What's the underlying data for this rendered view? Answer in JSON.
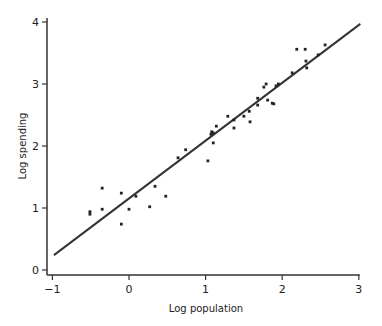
{
  "chart_data": {
    "type": "scatter",
    "title": "",
    "xlabel": "Log population",
    "ylabel": "Log spending",
    "xlim": [
      -1,
      3
    ],
    "ylim": [
      0,
      4
    ],
    "xticks": [
      -1,
      0,
      1,
      2,
      3
    ],
    "yticks": [
      0,
      1,
      2,
      3,
      4
    ],
    "xtick_labels": [
      "−1",
      "0",
      "1",
      "2",
      "3"
    ],
    "ytick_labels": [
      "0",
      "1",
      "2",
      "3",
      "4"
    ],
    "grid": false,
    "legend": null,
    "series": [
      {
        "name": "observations",
        "type": "scatter",
        "points": [
          [
            -0.51,
            0.94
          ],
          [
            -0.51,
            0.9
          ],
          [
            -0.35,
            1.32
          ],
          [
            -0.35,
            0.98
          ],
          [
            -0.1,
            1.24
          ],
          [
            -0.1,
            0.74
          ],
          [
            0.0,
            0.98
          ],
          [
            0.09,
            1.19
          ],
          [
            0.27,
            1.02
          ],
          [
            0.34,
            1.35
          ],
          [
            0.48,
            1.19
          ],
          [
            0.64,
            1.81
          ],
          [
            0.74,
            1.94
          ],
          [
            1.03,
            1.76
          ],
          [
            1.1,
            2.05
          ],
          [
            1.07,
            2.19
          ],
          [
            1.08,
            2.23
          ],
          [
            1.1,
            2.21
          ],
          [
            1.14,
            2.32
          ],
          [
            1.29,
            2.48
          ],
          [
            1.37,
            2.29
          ],
          [
            1.37,
            2.42
          ],
          [
            1.5,
            2.48
          ],
          [
            1.57,
            2.56
          ],
          [
            1.58,
            2.39
          ],
          [
            1.68,
            2.66
          ],
          [
            1.68,
            2.77
          ],
          [
            1.76,
            2.95
          ],
          [
            1.79,
            3.0
          ],
          [
            1.81,
            2.74
          ],
          [
            1.87,
            2.69
          ],
          [
            1.89,
            2.68
          ],
          [
            1.92,
            2.97
          ],
          [
            1.95,
            3.0
          ],
          [
            2.13,
            3.18
          ],
          [
            2.19,
            3.56
          ],
          [
            2.3,
            3.56
          ],
          [
            2.31,
            3.37
          ],
          [
            2.32,
            3.26
          ],
          [
            2.47,
            3.47
          ],
          [
            2.56,
            3.63
          ]
        ]
      },
      {
        "name": "fit line",
        "type": "line",
        "points": [
          [
            -0.98,
            0.24
          ],
          [
            3.02,
            3.97
          ]
        ]
      }
    ]
  },
  "colors": {
    "axis": "#333333",
    "points": "#222222",
    "line": "#333333"
  }
}
